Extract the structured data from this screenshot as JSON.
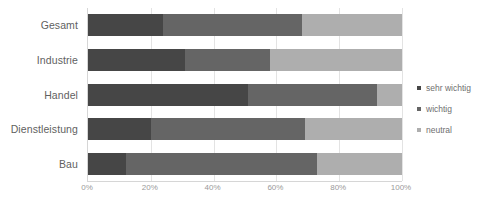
{
  "chart_data": {
    "type": "bar",
    "orientation": "horizontal",
    "stacked": true,
    "normalized": true,
    "title": "",
    "xlabel": "",
    "ylabel": "",
    "xlim": [
      0,
      100
    ],
    "xticks": [
      "0%",
      "20%",
      "40%",
      "60%",
      "80%",
      "100%"
    ],
    "xtick_values": [
      0,
      20,
      40,
      60,
      80,
      100
    ],
    "grid": true,
    "grid_axis": "x",
    "legend_position": "right",
    "categories": [
      "Gesamt",
      "Industrie",
      "Handel",
      "Dienstleistung",
      "Bau"
    ],
    "series": [
      {
        "name": "sehr wichtig",
        "color": "#464646",
        "values": [
          24,
          31,
          51,
          20,
          12
        ]
      },
      {
        "name": "wichtig",
        "color": "#656565",
        "values": [
          44,
          27,
          41,
          49,
          61
        ]
      },
      {
        "name": "neutral",
        "color": "#aeaeae",
        "values": [
          32,
          42,
          8,
          31,
          27
        ]
      }
    ]
  },
  "legend": {
    "items": [
      {
        "label": "sehr wichtig",
        "color": "#464646"
      },
      {
        "label": "wichtig",
        "color": "#656565"
      },
      {
        "label": "neutral",
        "color": "#aeaeae"
      }
    ]
  },
  "colors": {
    "sehr_wichtig": "#464646",
    "wichtig": "#656565",
    "neutral": "#aeaeae",
    "gridline": "#e3e3e3",
    "axis": "#d6d6d6",
    "label_text": "#5f5f5f",
    "tick_text": "#9a9a9a",
    "background": "#ffffff"
  }
}
